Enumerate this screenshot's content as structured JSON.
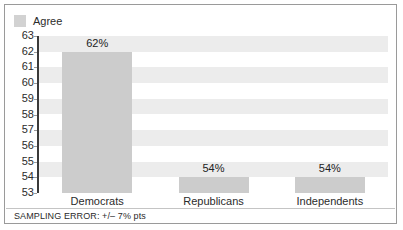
{
  "legend": {
    "swatch_name": "legend-swatch-agree",
    "label": "Agree",
    "color": "#d2d2d2"
  },
  "footer": {
    "note": "SAMPLING ERROR: +/– 7% pts"
  },
  "chart_data": {
    "type": "bar",
    "title": "",
    "subtitle": "",
    "xlabel": "",
    "ylabel": "",
    "categories": [
      "Democrats",
      "Republicans",
      "Independents"
    ],
    "values": [
      62,
      54,
      54
    ],
    "value_labels": [
      "62%",
      "54%",
      "54%"
    ],
    "series": [
      {
        "name": "Agree",
        "values": [
          62,
          54,
          54
        ],
        "color": "#cccccc"
      }
    ],
    "ylim": [
      53,
      63
    ],
    "ytick_labels": [
      "63",
      "62",
      "61",
      "60",
      "59",
      "58",
      "57",
      "56",
      "55",
      "54",
      "53"
    ],
    "ytick_values": [
      63,
      62,
      61,
      60,
      59,
      58,
      57,
      56,
      55,
      54,
      53
    ],
    "grid": false,
    "banding": true,
    "band_color": "#ececec",
    "legend_position": "top-left",
    "annotations": [
      "SAMPLING ERROR: +/– 7% pts"
    ]
  }
}
